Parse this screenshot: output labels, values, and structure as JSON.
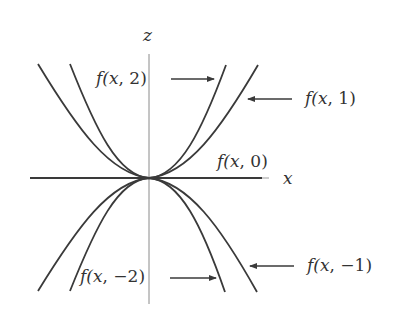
{
  "diagram": {
    "axes": {
      "vertical_label": "z",
      "horizontal_label": "x"
    },
    "curves": [
      {
        "id": "f2",
        "label": "f(x, 2)",
        "parameter": 2,
        "direction": "up",
        "width": "narrow"
      },
      {
        "id": "f1",
        "label": "f(x, 1)",
        "parameter": 1,
        "direction": "up",
        "width": "wide"
      },
      {
        "id": "f0",
        "label": "f(x, 0)",
        "parameter": 0,
        "direction": "flat",
        "width": "line"
      },
      {
        "id": "fm1",
        "label": "f(x, −1)",
        "parameter": -1,
        "direction": "down",
        "width": "wide"
      },
      {
        "id": "fm2",
        "label": "f(x, −2)",
        "parameter": -2,
        "direction": "down",
        "width": "narrow"
      }
    ],
    "labels": {
      "f2": {
        "pre": "f(",
        "var": "x",
        "post": ", 2)"
      },
      "f1": {
        "pre": "f(",
        "var": "x",
        "post": ", 1)"
      },
      "f0": {
        "pre": "f(",
        "var": "x",
        "post": ", 0)"
      },
      "fm1": {
        "pre": "f(",
        "var": "x",
        "post": ", −1)"
      },
      "fm2": {
        "pre": "f(",
        "var": "x",
        "post": ", −2)"
      }
    },
    "colors": {
      "curve": "#3a3a3a",
      "axis": "#8a8a8a",
      "text": "#333333",
      "background": "#ffffff"
    }
  }
}
